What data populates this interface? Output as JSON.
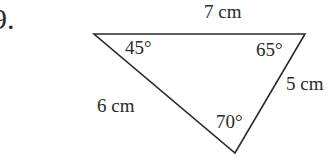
{
  "problem": {
    "number": "9."
  },
  "triangle": {
    "vertices": [
      [
        94,
        34
      ],
      [
        305,
        34
      ],
      [
        235,
        153
      ]
    ],
    "stroke": "#2a2a2a",
    "sides": [
      {
        "id": "top",
        "label": "7 cm"
      },
      {
        "id": "right",
        "label": "5 cm"
      },
      {
        "id": "left",
        "label": "6 cm"
      }
    ],
    "angles": [
      {
        "vertex": "top-left",
        "label": "45°"
      },
      {
        "vertex": "top-right",
        "label": "65°"
      },
      {
        "vertex": "bottom",
        "label": "70°"
      }
    ]
  }
}
